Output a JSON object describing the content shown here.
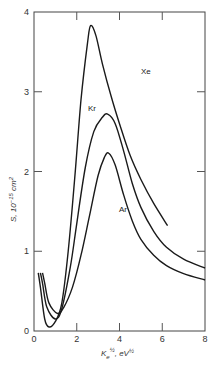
{
  "chart_data": {
    "type": "line",
    "title": "",
    "xlabel": "K_e^1/2, eV^1/2",
    "ylabel": "S, 10^-15 cm^2",
    "xlim": [
      0,
      8
    ],
    "ylim": [
      0,
      4
    ],
    "x_ticks": [
      "0",
      "2",
      "4",
      "6",
      "8"
    ],
    "y_ticks": [
      "0",
      "1",
      "2",
      "3",
      "4"
    ],
    "grid": false,
    "legend": "inline labels",
    "series": [
      {
        "name": "Xe",
        "points": [
          [
            0.2,
            0.73
          ],
          [
            0.3,
            0.55
          ],
          [
            0.5,
            0.15
          ],
          [
            0.7,
            0.05
          ],
          [
            1.0,
            0.12
          ],
          [
            1.3,
            0.35
          ],
          [
            1.6,
            1.0
          ],
          [
            1.9,
            1.9
          ],
          [
            2.2,
            2.9
          ],
          [
            2.5,
            3.6
          ],
          [
            2.65,
            3.83
          ],
          [
            2.9,
            3.7
          ],
          [
            3.2,
            3.35
          ],
          [
            3.6,
            2.95
          ],
          [
            4.0,
            2.6
          ],
          [
            4.5,
            2.2
          ],
          [
            5.0,
            1.9
          ],
          [
            5.6,
            1.6
          ],
          [
            6.25,
            1.32
          ]
        ]
      },
      {
        "name": "Kr",
        "points": [
          [
            0.3,
            0.73
          ],
          [
            0.4,
            0.6
          ],
          [
            0.6,
            0.3
          ],
          [
            1.0,
            0.15
          ],
          [
            1.3,
            0.28
          ],
          [
            1.7,
            0.8
          ],
          [
            2.0,
            1.35
          ],
          [
            2.4,
            2.05
          ],
          [
            2.8,
            2.5
          ],
          [
            3.2,
            2.68
          ],
          [
            3.45,
            2.72
          ],
          [
            3.8,
            2.6
          ],
          [
            4.2,
            2.25
          ],
          [
            4.6,
            1.85
          ],
          [
            5.0,
            1.55
          ],
          [
            5.6,
            1.25
          ],
          [
            6.2,
            1.05
          ],
          [
            7.0,
            0.9
          ],
          [
            8.0,
            0.79
          ]
        ]
      },
      {
        "name": "Ar",
        "points": [
          [
            0.4,
            0.73
          ],
          [
            0.5,
            0.6
          ],
          [
            0.7,
            0.35
          ],
          [
            1.1,
            0.22
          ],
          [
            1.4,
            0.3
          ],
          [
            1.8,
            0.55
          ],
          [
            2.2,
            0.95
          ],
          [
            2.6,
            1.45
          ],
          [
            3.0,
            1.95
          ],
          [
            3.3,
            2.18
          ],
          [
            3.5,
            2.23
          ],
          [
            3.8,
            2.08
          ],
          [
            4.2,
            1.7
          ],
          [
            4.6,
            1.38
          ],
          [
            5.0,
            1.15
          ],
          [
            5.6,
            0.95
          ],
          [
            6.2,
            0.82
          ],
          [
            7.0,
            0.72
          ],
          [
            8.0,
            0.64
          ]
        ]
      }
    ]
  },
  "labels": {
    "xe": "Xe",
    "kr": "Kr",
    "ar": "Ar",
    "x_axis": "K",
    "x_axis_sub": "e",
    "x_axis_sup": "½",
    "x_axis_unit": ", eV",
    "x_axis_unit_sup": "½",
    "y_axis": "S, 10",
    "y_axis_sup": "−15",
    "y_axis_unit": " cm",
    "y_axis_unit_sup": "2"
  }
}
